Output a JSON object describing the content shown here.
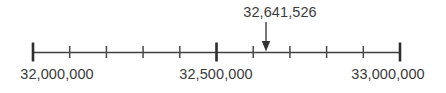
{
  "figure": {
    "type": "number-line",
    "title": "",
    "colors": {
      "line": "#3f3f3f",
      "tick_major": "#2e2e2e",
      "tick_minor": "#4a4a4a",
      "text": "#3b3b3b",
      "arrow": "#333333",
      "background": "#ffffff"
    }
  },
  "chart_data": {
    "type": "line",
    "title": "",
    "xlabel": "",
    "ylabel": "",
    "orientation": "horizontal",
    "xlim": [
      32000000,
      33000000
    ],
    "grid": false,
    "legend": null,
    "major_tick_interval": 500000,
    "minor_tick_interval": 100000,
    "major_ticks": [
      {
        "value": 32000000,
        "label": "32,000,000",
        "x_px": 33
      },
      {
        "value": 32500000,
        "label": "32,500,000",
        "x_px": 216.5
      },
      {
        "value": 33000000,
        "label": "33,000,000",
        "x_px": 400
      }
    ],
    "minor_ticks": [
      {
        "value": 32100000,
        "x_px": 69.7
      },
      {
        "value": 32200000,
        "x_px": 106.4
      },
      {
        "value": 32300000,
        "x_px": 143.1
      },
      {
        "value": 32400000,
        "x_px": 179.8
      },
      {
        "value": 32600000,
        "x_px": 253.2
      },
      {
        "value": 32700000,
        "x_px": 289.9
      },
      {
        "value": 32800000,
        "x_px": 326.6
      },
      {
        "value": 32900000,
        "x_px": 363.3
      }
    ],
    "annotations": [
      {
        "label": "32,641,526",
        "value": 32641526,
        "x_px": 266,
        "marker": "down-arrow"
      }
    ]
  },
  "axis": {
    "tick_labels": [
      {
        "text": "32,000,000",
        "x_px": 57,
        "y_px": 66
      },
      {
        "text": "32,500,000",
        "x_px": 216,
        "y_px": 66
      },
      {
        "text": "33,000,000",
        "x_px": 388,
        "y_px": 66
      }
    ]
  },
  "pointer": {
    "label": "32,641,526",
    "label_x_px": 280,
    "label_y_px": 4
  }
}
